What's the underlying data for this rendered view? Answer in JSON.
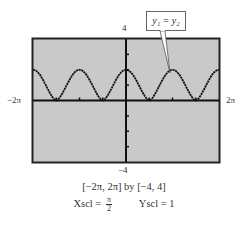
{
  "chart_data": {
    "type": "line",
    "title": "",
    "xlabel": "",
    "ylabel": "",
    "xlim_label": [
      "-2π",
      "2π"
    ],
    "xlim": [
      -6.2832,
      6.2832
    ],
    "ylim": [
      -4,
      4
    ],
    "grid": false,
    "legend": null,
    "x_tick_spacing_label": "π/2",
    "y_tick_spacing": 1,
    "series": [
      {
        "name": "y1 = y2",
        "description": "periodic curve, period π, peaks of ~2 at x = -2π, -π, 0, π, 2π; touches 0 at x = ±π/2, ±3π/2",
        "x": [
          -6.2832,
          -5.4978,
          -4.7124,
          -3.927,
          -3.1416,
          -2.3562,
          -1.5708,
          -0.7854,
          0,
          0.7854,
          1.5708,
          2.3562,
          3.1416,
          3.927,
          4.7124,
          5.4978,
          6.2832
        ],
        "y": [
          2,
          1,
          0,
          1,
          2,
          1,
          0,
          1,
          2,
          1,
          0,
          1,
          2,
          1,
          0,
          1,
          2
        ]
      }
    ],
    "annotations": [
      {
        "text": "y1 = y2",
        "points_to": [
          3.1416,
          2
        ]
      }
    ],
    "background": "#c9c9c9",
    "line_color": "#111111"
  },
  "labels": {
    "y_max": "4",
    "y_min": "−4",
    "x_min": "−2π",
    "x_max": "2π",
    "callout": "y₁ = y₂",
    "window": "[−2π, 2π]  by  [−4, 4]",
    "xscl_prefix": "Xscl =",
    "xscl_num": "π",
    "xscl_den": "2",
    "yscl": "Yscl = 1"
  }
}
